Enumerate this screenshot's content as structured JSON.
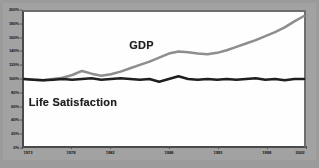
{
  "chart_data": {
    "type": "line",
    "title": "",
    "subtitle": "",
    "xlabel": "",
    "ylabel": "",
    "xlim": [
      1973,
      2002
    ],
    "ylim": [
      0,
      200
    ],
    "grid": false,
    "legend_position": "inline-annotation",
    "y_tick_labels": [
      "0%",
      "20%",
      "40%",
      "60%",
      "80%",
      "100%",
      "120%",
      "140%",
      "160%",
      "180%",
      "200%"
    ],
    "y_tick_values": [
      0,
      20,
      40,
      60,
      80,
      100,
      120,
      140,
      160,
      180,
      200
    ],
    "x_tick_labels": [
      "1973",
      "1978",
      "1982",
      "1988",
      "1993",
      "1998",
      "2002"
    ],
    "x_tick_values": [
      1973,
      1978,
      1982,
      1988,
      1993,
      1998,
      2002
    ],
    "annotations": [
      {
        "text": "GDP",
        "x": 1985,
        "y": 152
      },
      {
        "text": "Life Satisfaction",
        "x": 1978,
        "y": 70
      }
    ],
    "series": [
      {
        "name": "GDP",
        "color": "#8e8e8e",
        "x": [
          1973,
          1974,
          1975,
          1976,
          1977,
          1978,
          1979,
          1980,
          1981,
          1982,
          1983,
          1984,
          1985,
          1986,
          1987,
          1988,
          1989,
          1990,
          1991,
          1992,
          1993,
          1994,
          1995,
          1996,
          1997,
          1998,
          1999,
          2000,
          2001,
          2002
        ],
        "values": [
          100,
          99,
          98,
          100,
          102,
          106,
          112,
          108,
          105,
          107,
          111,
          116,
          121,
          126,
          132,
          138,
          141,
          140,
          138,
          137,
          139,
          143,
          148,
          153,
          158,
          164,
          170,
          177,
          186,
          194
        ]
      },
      {
        "name": "Life Satisfaction",
        "color": "#1c1c1c",
        "x": [
          1973,
          1974,
          1975,
          1976,
          1977,
          1978,
          1979,
          1980,
          1981,
          1982,
          1983,
          1984,
          1985,
          1986,
          1987,
          1988,
          1989,
          1990,
          1991,
          1992,
          1993,
          1994,
          1995,
          1996,
          1997,
          1998,
          1999,
          2000,
          2001,
          2002
        ],
        "values": [
          100,
          99,
          98,
          99,
          100,
          99,
          100,
          101,
          99,
          100,
          101,
          100,
          99,
          100,
          96,
          100,
          104,
          100,
          99,
          100,
          99,
          100,
          99,
          100,
          101,
          99,
          100,
          98,
          100,
          100
        ]
      }
    ]
  },
  "axes": {
    "y_labels": [
      "200%",
      "180%",
      "160%",
      "140%",
      "120%",
      "100%",
      "80%",
      "60%",
      "40%",
      "20%",
      "0%"
    ],
    "x_labels": [
      "1973",
      "1978",
      "1982",
      "1988",
      "1993",
      "1998",
      "2002"
    ]
  },
  "labels": {
    "gdp": "GDP",
    "life_satisfaction": "Life Satisfaction"
  },
  "colors": {
    "gdp_line": "#8e8e8e",
    "life_line": "#1c1c1c",
    "plot_background": "#fefefe",
    "surround": "#9b9b9b",
    "axis": "#4a4a4a"
  }
}
